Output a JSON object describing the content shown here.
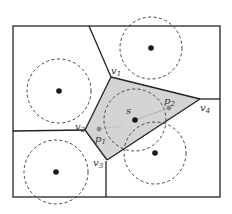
{
  "diagram": {
    "type": "voronoi-with-disks",
    "colors": {
      "border": "#333333",
      "edge": "#222222",
      "cell_fill": "#d4d4d4",
      "site": "#1a1a1a",
      "witness": "#888888",
      "disk_stroke": "#444444",
      "segment": "#aaaaaa"
    },
    "labels": {
      "s": "s",
      "v1": "v",
      "v1_sub": "1",
      "v2": "v",
      "v2_sub": "2",
      "v3": "v",
      "v3_sub": "3",
      "v4": "v",
      "v4_sub": "4",
      "p1": "p",
      "p1_sub": "1",
      "p2": "p",
      "p2_sub": "2"
    },
    "sites": [
      {
        "name": "top-right",
        "x": 151,
        "y": 48,
        "r": 31
      },
      {
        "name": "left",
        "x": 59,
        "y": 91,
        "r": 32
      },
      {
        "name": "bottom-left",
        "x": 56,
        "y": 172,
        "r": 32
      },
      {
        "name": "s",
        "x": 135,
        "y": 120,
        "r": 31
      },
      {
        "name": "bottom-right",
        "x": 155,
        "y": 153,
        "r": 31
      }
    ],
    "vertices": {
      "v1": [
        111,
        77
      ],
      "v2": [
        85,
        130
      ],
      "v3": [
        107,
        160
      ],
      "v4": [
        200,
        99
      ]
    },
    "witness_points": {
      "p1": [
        99,
        129
      ],
      "p2": [
        169,
        108
      ]
    }
  }
}
